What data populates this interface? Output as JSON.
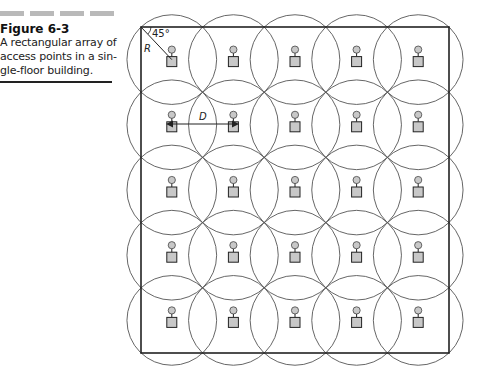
{
  "caption": {
    "figure_label": "Figure 6-3",
    "lines": [
      "A rectangular array of",
      "access points in a sin-",
      "gle-floor building."
    ]
  },
  "diagram": {
    "title": "Rectangular array of access points",
    "grid": {
      "rows": 5,
      "cols": 5
    },
    "building_outline": {
      "x": 141,
      "y": 27,
      "width": 308,
      "height": 326
    },
    "coverage_radius_px": 45,
    "labels": {
      "angle": "45°",
      "radius": "R",
      "distance": "D"
    },
    "colors": {
      "line": "#222222",
      "ap_fill": "#c8c8c8",
      "circle": "#555555"
    }
  }
}
